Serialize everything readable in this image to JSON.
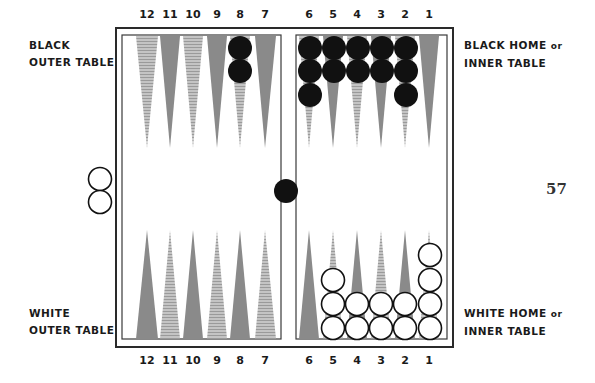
{
  "labels": {
    "black_outer": [
      "BLACK",
      "OUTER TABLE"
    ],
    "black_home": [
      "BLACK HOME",
      "or",
      "INNER TABLE"
    ],
    "white_outer": [
      "WHITE",
      "OUTER TABLE"
    ],
    "white_home": [
      "WHITE HOME",
      "or",
      "INNER TABLE"
    ]
  },
  "page_number": "57",
  "top_point_numbers": [
    "12",
    "11",
    "10",
    "9",
    "8",
    "7",
    "6",
    "5",
    "4",
    "3",
    "2",
    "1"
  ],
  "bottom_point_numbers": [
    "12",
    "11",
    "10",
    "9",
    "8",
    "7",
    "6",
    "5",
    "4",
    "3",
    "2",
    "1"
  ],
  "colors": {
    "frame": "#2a2a2a",
    "triangle_dark": "#8a8a8a",
    "triangle_light": "#b4b4b4",
    "black_checker": "#111111",
    "white_checker": "#ffffff"
  },
  "position": {
    "black_checkers": [
      {
        "point": 8,
        "side": "top",
        "count": 2
      },
      {
        "point": 6,
        "side": "top",
        "count": 3
      },
      {
        "point": 5,
        "side": "top",
        "count": 2
      },
      {
        "point": 4,
        "side": "top",
        "count": 2
      },
      {
        "point": 3,
        "side": "top",
        "count": 2
      },
      {
        "point": 2,
        "side": "top",
        "count": 3
      },
      {
        "point": "bar",
        "count": 1
      }
    ],
    "white_checkers": [
      {
        "point": 5,
        "side": "bottom",
        "count": 3
      },
      {
        "point": 4,
        "side": "bottom",
        "count": 2
      },
      {
        "point": 3,
        "side": "bottom",
        "count": 2
      },
      {
        "point": 2,
        "side": "bottom",
        "count": 2
      },
      {
        "point": 1,
        "side": "bottom",
        "count": 4
      },
      {
        "point": "off",
        "count": 2
      }
    ]
  }
}
